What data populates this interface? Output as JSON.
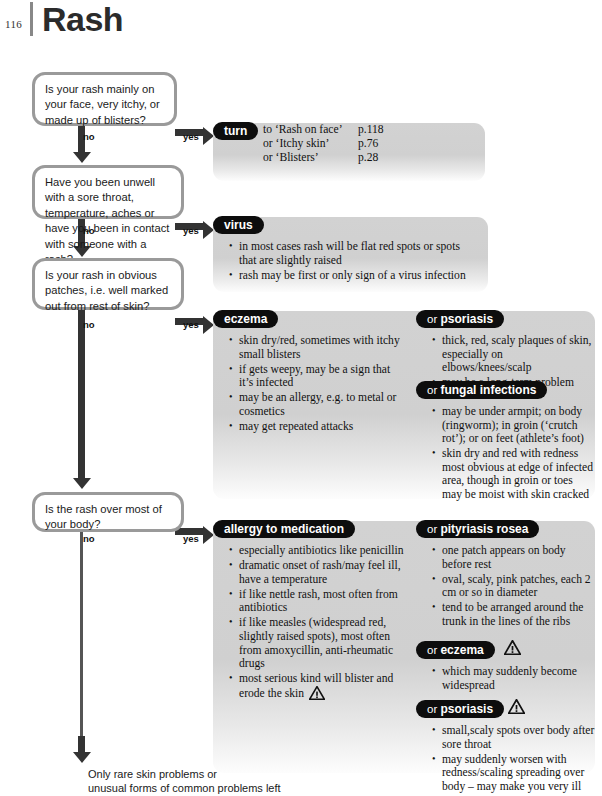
{
  "header": {
    "page_number": "116",
    "title": "Rash"
  },
  "questions": [
    {
      "id": "q1",
      "text": "Is your rash mainly on your face, very itchy, or made up of blisters?",
      "no_label": "no",
      "yes_label": "yes"
    },
    {
      "id": "q2",
      "text": "Have you been unwell with a sore throat, temperature, aches or have you been in contact with someone with a rash?",
      "no_label": "no",
      "yes_label": "yes"
    },
    {
      "id": "q3",
      "text": "Is your rash in obvious patches, i.e. well marked out from rest of skin?",
      "no_label": "no",
      "yes_label": "yes"
    },
    {
      "id": "q4",
      "text": "Is the rash over most of your body?",
      "no_label": "no",
      "yes_label": "yes"
    }
  ],
  "outcomes": {
    "turn": {
      "pill": "turn",
      "refs": [
        {
          "text": "to ‘Rash on face’",
          "page": "p.118"
        },
        {
          "text": "or ‘Itchy skin’",
          "page": "p.76"
        },
        {
          "text": "or ‘Blisters’",
          "page": "p.28"
        }
      ]
    },
    "virus": {
      "pill": "virus",
      "bullets": [
        "in most cases rash will be flat red spots or spots that are slightly raised",
        "rash may be first or only sign of a virus infection"
      ]
    },
    "eczema": {
      "pill": "eczema",
      "bullets": [
        "skin dry/red, sometimes with itchy small blisters",
        "if gets weepy, may be a sign that it’s infected",
        "may be an allergy, e.g. to metal or cosmetics",
        "may get repeated attacks"
      ]
    },
    "psoriasis": {
      "or": "or ",
      "pill": "psoriasis",
      "bullets": [
        "thick, red, scaly plaques of skin, especially on elbows/knees/scalp",
        "may be a long-term problem"
      ]
    },
    "fungal": {
      "or": "or ",
      "pill": "fungal infections",
      "bullets": [
        "may be under armpit; on body (ringworm); in groin (‘crutch rot’); or on feet (athlete’s foot)",
        "skin dry and red with redness most obvious at edge of infected area, though in groin or toes may be moist with skin cracked"
      ]
    },
    "allergy": {
      "pill": "allergy to medication",
      "bullets": [
        "especially antibiotics like penicillin",
        "dramatic onset of rash/may feel ill, have a temperature",
        "if like nettle rash, most often from antibiotics",
        "if like measles (widespread red, slightly raised spots), most often from amoxycillin, anti-rheumatic drugs",
        "most serious kind will blister and erode the skin"
      ],
      "warning_on_last_bullet": true
    },
    "pityriasis": {
      "or": "or ",
      "pill": "pityriasis rosea",
      "bullets": [
        "one patch appears on body before rest",
        "oval, scaly, pink patches, each 2 cm or so in diameter",
        "tend to be arranged around the trunk in the lines of the ribs"
      ]
    },
    "eczema2": {
      "or": "or ",
      "pill": "eczema",
      "warning": true,
      "bullets": [
        "which may suddenly become widespread"
      ]
    },
    "psoriasis2": {
      "or": "or ",
      "pill": "psoriasis",
      "warning": true,
      "bullets": [
        "small,scaly spots over body after sore throat",
        "may suddenly worsen with redness/scaling spreading over body – may make you very ill"
      ]
    }
  },
  "footnote": {
    "line1": "Only rare skin problems or",
    "line2": "unusual forms of common problems left"
  },
  "colors": {
    "panel_gray": "#d0d0d0",
    "pill_black": "#0d0d0d",
    "box_border": "#9a9a9a",
    "arrow": "#333333"
  }
}
